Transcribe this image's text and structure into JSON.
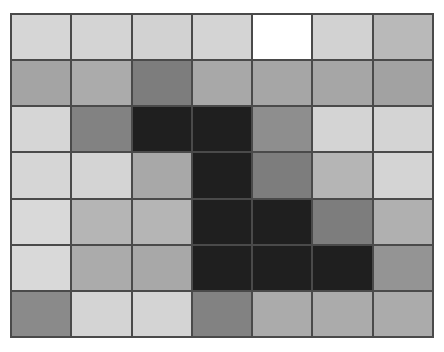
{
  "page": {
    "background_color": "#ffffff",
    "width": 444,
    "height": 352
  },
  "grid": {
    "rows": 7,
    "columns": 7,
    "gridline_color": "#4a4a4a",
    "gridline_width_px": 2,
    "origin_x": 10,
    "origin_y": 13,
    "width_px": 424,
    "height_px": 325,
    "palette": {
      "white": "#ffffff",
      "light": "#d6d6d6",
      "light_alt": "#d2d2d2",
      "medium_light": "#bdbdbd",
      "medium": "#a8a8a8",
      "medium_dark": "#8e8e8e",
      "dark": "#7a7a7a",
      "black": "#1f1f1f"
    },
    "cell_colors": [
      [
        "#d6d6d6",
        "#d4d4d4",
        "#d2d2d2",
        "#d4d4d4",
        "#ffffff",
        "#d2d2d2",
        "#b9b9b9"
      ],
      [
        "#a4a4a4",
        "#ababab",
        "#7d7d7d",
        "#a8a8a8",
        "#a6a6a6",
        "#a6a6a6",
        "#a2a2a2"
      ],
      [
        "#d6d6d6",
        "#828282",
        "#1f1f1f",
        "#1f1f1f",
        "#8e8e8e",
        "#d4d4d4",
        "#d4d4d4"
      ],
      [
        "#d6d6d6",
        "#d4d4d4",
        "#a8a8a8",
        "#1f1f1f",
        "#7d7d7d",
        "#b5b5b5",
        "#d4d4d4"
      ],
      [
        "#d9d9d9",
        "#b5b5b5",
        "#b5b5b5",
        "#1f1f1f",
        "#1f1f1f",
        "#7d7d7d",
        "#b0b0b0"
      ],
      [
        "#d9d9d9",
        "#ababab",
        "#a8a8a8",
        "#1f1f1f",
        "#1f1f1f",
        "#1f1f1f",
        "#949494"
      ],
      [
        "#8a8a8a",
        "#d4d4d4",
        "#d4d4d4",
        "#828282",
        "#ababab",
        "#ababab",
        "#ababab"
      ]
    ],
    "cell_labels": [
      [
        "r1c1",
        "r1c2",
        "r1c3",
        "r1c4",
        "r1c5",
        "r1c6",
        "r1c7"
      ],
      [
        "r2c1",
        "r2c2",
        "r2c3",
        "r2c4",
        "r2c5",
        "r2c6",
        "r2c7"
      ],
      [
        "r3c1",
        "r3c2",
        "r3c3",
        "r3c4",
        "r3c5",
        "r3c6",
        "r3c7"
      ],
      [
        "r4c1",
        "r4c2",
        "r4c3",
        "r4c4",
        "r4c5",
        "r4c6",
        "r4c7"
      ],
      [
        "r5c1",
        "r5c2",
        "r5c3",
        "r5c4",
        "r5c5",
        "r5c6",
        "r5c7"
      ],
      [
        "r6c1",
        "r6c2",
        "r6c3",
        "r6c4",
        "r6c5",
        "r6c6",
        "r6c7"
      ],
      [
        "r7c1",
        "r7c2",
        "r7c3",
        "r7c4",
        "r7c5",
        "r7c6",
        "r7c7"
      ]
    ]
  },
  "chart_data": {
    "type": "heatmap",
    "title": "",
    "xlabel": "",
    "ylabel": "",
    "grid": true,
    "legend": "none",
    "categories_x": [
      "1",
      "2",
      "3",
      "4",
      "5",
      "6",
      "7"
    ],
    "categories_y": [
      "1",
      "2",
      "3",
      "4",
      "5",
      "6",
      "7"
    ],
    "colorscale": "grayscale",
    "value_range": [
      0,
      255
    ],
    "values": [
      [
        214,
        212,
        210,
        212,
        255,
        210,
        185
      ],
      [
        164,
        171,
        125,
        168,
        166,
        166,
        162
      ],
      [
        214,
        130,
        31,
        31,
        142,
        212,
        212
      ],
      [
        214,
        212,
        168,
        31,
        125,
        181,
        212
      ],
      [
        217,
        181,
        181,
        31,
        31,
        125,
        176
      ],
      [
        217,
        171,
        168,
        31,
        31,
        31,
        148
      ],
      [
        138,
        212,
        212,
        130,
        171,
        171,
        171
      ]
    ]
  }
}
